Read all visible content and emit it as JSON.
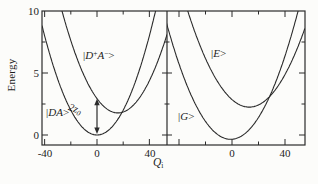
{
  "figure": {
    "background": "#fcfcfa",
    "line_color": "#2b2b2b",
    "text_color": "#1c1c1c"
  },
  "axes": {
    "energy_axis": {
      "title": "Energy",
      "tick_labels": [
        "10",
        "5",
        "0"
      ]
    },
    "q_axis": {
      "title_main": "Q",
      "title_sub": "i",
      "left_panel_tick_labels": [
        "-40",
        "0",
        "40"
      ],
      "right_panel_tick_labels": [
        "0",
        "40"
      ]
    }
  },
  "states": {
    "da": {
      "pre": "|",
      "main": "DA",
      "ket": ">"
    },
    "dpam": {
      "pre": "|",
      "d": "D",
      "sup_plus": "+",
      "a": "A",
      "sup_minus": "−",
      "ket": ">"
    },
    "e": {
      "pre": "|",
      "main": "E",
      "ket": ">"
    },
    "g": {
      "pre": "|",
      "main": "G",
      "ket": ">"
    }
  },
  "annotation_2z0": {
    "coeff": "2",
    "symbol": "z",
    "sub": "0"
  },
  "chart_data": [
    {
      "type": "line",
      "panel": "left",
      "xlabel": "Q_i",
      "ylabel": "Energy",
      "xlim": [
        -42,
        53.5
      ],
      "ylim": [
        -0.8,
        10
      ],
      "xticks": [
        -40,
        0,
        40
      ],
      "xticks_minor": [
        -20,
        20
      ],
      "yticks": [
        0,
        5,
        10
      ],
      "yticks_minor": [
        2.5,
        7.5
      ],
      "grid": false,
      "series": [
        {
          "id": "da",
          "name": "|DA>",
          "model": "parabola",
          "k": 0.005,
          "q_min": 0,
          "e_min": 0
        },
        {
          "id": "dpam",
          "name": "|D+A->",
          "model": "parabola",
          "k": 0.0045,
          "q_min": 16,
          "e_min": 1.78
        }
      ],
      "annotations": [
        {
          "text": "2z0",
          "type": "double_arrow",
          "q": 0,
          "e_from": 0,
          "e_to": 2.93
        }
      ]
    },
    {
      "type": "line",
      "panel": "right",
      "xlabel": "Q_i",
      "ylabel": "Energy",
      "xlim": [
        -49.5,
        55.2
      ],
      "ylim": [
        -0.8,
        10
      ],
      "xticks": [
        -40,
        0,
        40
      ],
      "xticks_minor": [
        -20,
        20
      ],
      "yticks": [
        0,
        5,
        10
      ],
      "yticks_minor": [
        2.5,
        7.5
      ],
      "grid": false,
      "series": [
        {
          "id": "g",
          "name": "|G>",
          "model": "parabola",
          "k": 0.004,
          "q_min": -1,
          "e_min": -0.35
        },
        {
          "id": "e",
          "name": "|E>",
          "model": "parabola",
          "k": 0.0036,
          "q_min": 13,
          "e_min": 2.25
        }
      ],
      "annotations": []
    }
  ]
}
